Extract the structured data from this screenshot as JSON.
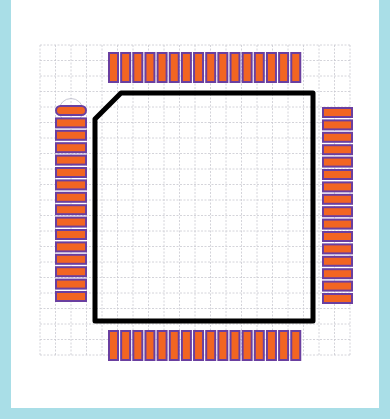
{
  "footprint": {
    "package": "QFP-64",
    "pads_per_side": 16,
    "sides": [
      "top",
      "right",
      "bottom",
      "left"
    ],
    "pin1_side": "left",
    "pin1_position": "top",
    "colors": {
      "frame": "#a9dee7",
      "panel": "#ffffff",
      "grid": "#c9c9d0",
      "pad_fill": "#f26522",
      "pad_stroke": "#6a3fa0",
      "outline": "#000000",
      "pin1_marker": "#b8b8c8"
    }
  },
  "grid": {
    "x_start": 40,
    "x_end": 350,
    "y_start": 45,
    "y_end": 355,
    "spacing": 15.5
  },
  "outline": {
    "x": 95,
    "y": 93,
    "x2": 313,
    "y2": 321,
    "chamfer": 26,
    "stroke_width": 5
  },
  "pads": {
    "top": {
      "x0": 109,
      "y": 53,
      "pitch": 12.15,
      "w": 9,
      "h": 29
    },
    "bottom": {
      "x0": 109,
      "y": 331,
      "pitch": 12.15,
      "w": 9,
      "h": 29
    },
    "left": {
      "x": 56,
      "y0": 106,
      "pitch": 12.4,
      "w": 30,
      "h": 9
    },
    "right": {
      "x": 323,
      "y0": 108,
      "pitch": 12.4,
      "w": 29,
      "h": 9
    }
  }
}
